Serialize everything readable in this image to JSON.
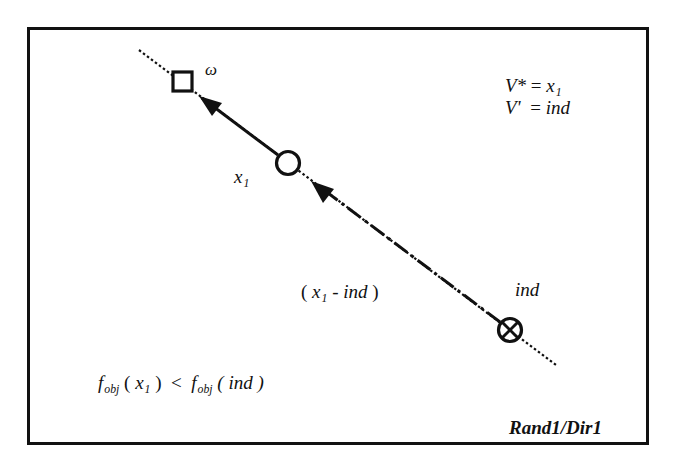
{
  "diagram": {
    "title_label": "Rand1/Dir1",
    "colors": {
      "stroke": "#111111",
      "background": "#ffffff"
    },
    "legend": {
      "line1": {
        "lhs": "V*",
        "eq": "=",
        "rhs_base": "x",
        "rhs_sub": "1"
      },
      "line2": {
        "lhs": "V'",
        "eq": "=",
        "rhs": "ind"
      }
    },
    "nodes": [
      {
        "id": "omega",
        "shape": "square",
        "label": "ω"
      },
      {
        "id": "x1",
        "shape": "circle",
        "label_base": "x",
        "label_sub": "1"
      },
      {
        "id": "ind",
        "shape": "circle-cross",
        "label": "ind"
      }
    ],
    "edges": [
      {
        "from": "ind",
        "to": "x1",
        "style": "dash-dot",
        "label": {
          "open": "(",
          "base": "x",
          "sub": "1",
          "rest": "- ind",
          "close": ")"
        }
      },
      {
        "from": "x1",
        "to": "omega",
        "style": "solid"
      }
    ],
    "guide_line": {
      "style": "dotted"
    },
    "condition": {
      "f1": "f",
      "f1_sub": "obj",
      "arg1_open": "(",
      "arg1_base": "x",
      "arg1_sub": "1",
      "arg1_close": ")",
      "op": "<",
      "f2": "f",
      "f2_sub": "obj",
      "arg2": "( ind )"
    }
  }
}
